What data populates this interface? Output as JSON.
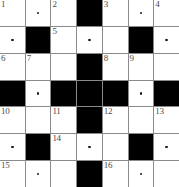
{
  "puzzle": {
    "title": "Crossword Grid",
    "columns": 7,
    "rows": 7,
    "colors": {
      "cell_background": "#ffffff",
      "block_background": "#000000",
      "grid_line": "#8a8a8a",
      "number_color": "#4a4a4a",
      "dot_color": "#1a1a1a"
    },
    "clue_numbers": [
      1,
      2,
      3,
      4,
      5,
      6,
      7,
      8,
      9,
      10,
      11,
      12,
      13,
      14,
      15,
      16
    ],
    "cells": [
      {
        "row": 1,
        "col": 1,
        "type": "open",
        "number": "1",
        "dot": false
      },
      {
        "row": 1,
        "col": 2,
        "type": "open",
        "number": "",
        "dot": true
      },
      {
        "row": 1,
        "col": 3,
        "type": "open",
        "number": "2",
        "dot": false
      },
      {
        "row": 1,
        "col": 4,
        "type": "block",
        "number": "",
        "dot": false
      },
      {
        "row": 1,
        "col": 5,
        "type": "open",
        "number": "3",
        "dot": false
      },
      {
        "row": 1,
        "col": 6,
        "type": "open",
        "number": "",
        "dot": true
      },
      {
        "row": 1,
        "col": 7,
        "type": "open",
        "number": "4",
        "dot": false
      },
      {
        "row": 2,
        "col": 1,
        "type": "open",
        "number": "",
        "dot": true
      },
      {
        "row": 2,
        "col": 2,
        "type": "block",
        "number": "",
        "dot": false
      },
      {
        "row": 2,
        "col": 3,
        "type": "open",
        "number": "5",
        "dot": false
      },
      {
        "row": 2,
        "col": 4,
        "type": "open",
        "number": "",
        "dot": true
      },
      {
        "row": 2,
        "col": 5,
        "type": "open",
        "number": "",
        "dot": false
      },
      {
        "row": 2,
        "col": 6,
        "type": "block",
        "number": "",
        "dot": false
      },
      {
        "row": 2,
        "col": 7,
        "type": "open",
        "number": "",
        "dot": true
      },
      {
        "row": 3,
        "col": 1,
        "type": "open",
        "number": "6",
        "dot": false
      },
      {
        "row": 3,
        "col": 2,
        "type": "open",
        "number": "7",
        "dot": false
      },
      {
        "row": 3,
        "col": 3,
        "type": "open",
        "number": "",
        "dot": false
      },
      {
        "row": 3,
        "col": 4,
        "type": "block",
        "number": "",
        "dot": false
      },
      {
        "row": 3,
        "col": 5,
        "type": "open",
        "number": "8",
        "dot": false
      },
      {
        "row": 3,
        "col": 6,
        "type": "open",
        "number": "9",
        "dot": false
      },
      {
        "row": 3,
        "col": 7,
        "type": "open",
        "number": "",
        "dot": false
      },
      {
        "row": 4,
        "col": 1,
        "type": "block",
        "number": "",
        "dot": false
      },
      {
        "row": 4,
        "col": 2,
        "type": "open",
        "number": "",
        "dot": true
      },
      {
        "row": 4,
        "col": 3,
        "type": "block",
        "number": "",
        "dot": false
      },
      {
        "row": 4,
        "col": 4,
        "type": "block",
        "number": "",
        "dot": false
      },
      {
        "row": 4,
        "col": 5,
        "type": "block",
        "number": "",
        "dot": false
      },
      {
        "row": 4,
        "col": 6,
        "type": "open",
        "number": "",
        "dot": true
      },
      {
        "row": 4,
        "col": 7,
        "type": "block",
        "number": "",
        "dot": false
      },
      {
        "row": 5,
        "col": 1,
        "type": "open",
        "number": "10",
        "dot": false
      },
      {
        "row": 5,
        "col": 2,
        "type": "open",
        "number": "",
        "dot": false
      },
      {
        "row": 5,
        "col": 3,
        "type": "open",
        "number": "11",
        "dot": false
      },
      {
        "row": 5,
        "col": 4,
        "type": "block",
        "number": "",
        "dot": false
      },
      {
        "row": 5,
        "col": 5,
        "type": "open",
        "number": "12",
        "dot": false
      },
      {
        "row": 5,
        "col": 6,
        "type": "open",
        "number": "",
        "dot": false
      },
      {
        "row": 5,
        "col": 7,
        "type": "open",
        "number": "13",
        "dot": false
      },
      {
        "row": 6,
        "col": 1,
        "type": "open",
        "number": "",
        "dot": true
      },
      {
        "row": 6,
        "col": 2,
        "type": "block",
        "number": "",
        "dot": false
      },
      {
        "row": 6,
        "col": 3,
        "type": "open",
        "number": "14",
        "dot": false
      },
      {
        "row": 6,
        "col": 4,
        "type": "open",
        "number": "",
        "dot": true
      },
      {
        "row": 6,
        "col": 5,
        "type": "open",
        "number": "",
        "dot": false
      },
      {
        "row": 6,
        "col": 6,
        "type": "block",
        "number": "",
        "dot": false
      },
      {
        "row": 6,
        "col": 7,
        "type": "open",
        "number": "",
        "dot": true
      },
      {
        "row": 7,
        "col": 1,
        "type": "open",
        "number": "15",
        "dot": false
      },
      {
        "row": 7,
        "col": 2,
        "type": "open",
        "number": "",
        "dot": true
      },
      {
        "row": 7,
        "col": 3,
        "type": "open",
        "number": "",
        "dot": false
      },
      {
        "row": 7,
        "col": 4,
        "type": "block",
        "number": "",
        "dot": false
      },
      {
        "row": 7,
        "col": 5,
        "type": "open",
        "number": "16",
        "dot": false
      },
      {
        "row": 7,
        "col": 6,
        "type": "open",
        "number": "",
        "dot": true
      },
      {
        "row": 7,
        "col": 7,
        "type": "open",
        "number": "",
        "dot": false
      }
    ]
  }
}
